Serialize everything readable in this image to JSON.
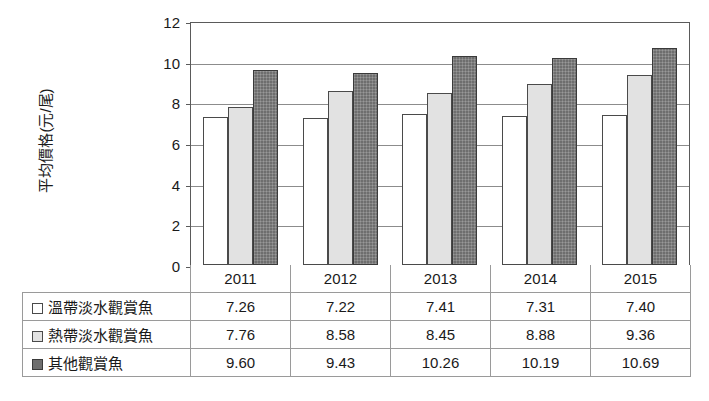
{
  "chart_data": {
    "type": "bar",
    "title": "",
    "xlabel": "",
    "ylabel": "平均價格(元/尾)",
    "ylim": [
      0,
      12
    ],
    "yticks": [
      12,
      10,
      8,
      6,
      4,
      2,
      0
    ],
    "grid": true,
    "legend_position": "table-below",
    "categories": [
      "2011",
      "2012",
      "2013",
      "2014",
      "2015"
    ],
    "series": [
      {
        "name": "溫帶淡水觀賞魚",
        "swatch": "white",
        "color": "#ffffff",
        "values": [
          7.26,
          7.22,
          7.41,
          7.31,
          7.4
        ],
        "labels": [
          "7.26",
          "7.22",
          "7.41",
          "7.31",
          "7.40"
        ]
      },
      {
        "name": "熱帶淡水觀賞魚",
        "swatch": "light-gray",
        "color": "#e2e2e2",
        "values": [
          7.76,
          8.58,
          8.45,
          8.88,
          9.36
        ],
        "labels": [
          "7.76",
          "8.58",
          "8.45",
          "8.88",
          "9.36"
        ]
      },
      {
        "name": "其他觀賞魚",
        "swatch": "dark-gray",
        "color": "#6e6e6e",
        "values": [
          9.6,
          9.43,
          10.26,
          10.19,
          10.69
        ],
        "labels": [
          "9.60",
          "9.43",
          "10.26",
          "10.19",
          "10.69"
        ]
      }
    ]
  },
  "axis": {
    "y_title": "平均價格(元/尾)",
    "tick_labels": [
      "12",
      "10",
      "8",
      "6",
      "4",
      "2",
      "0"
    ]
  },
  "table": {
    "year_headers": [
      "2011",
      "2012",
      "2013",
      "2014",
      "2015"
    ],
    "rows": [
      {
        "label": "溫帶淡水觀賞魚",
        "swatch_class": "s0",
        "values": [
          "7.26",
          "7.22",
          "7.41",
          "7.31",
          "7.40"
        ]
      },
      {
        "label": "熱帶淡水觀賞魚",
        "swatch_class": "s1",
        "values": [
          "7.76",
          "8.58",
          "8.45",
          "8.88",
          "9.36"
        ]
      },
      {
        "label": "其他觀賞魚",
        "swatch_class": "s2",
        "values": [
          "9.60",
          "9.43",
          "10.26",
          "10.19",
          "10.69"
        ]
      }
    ]
  },
  "colors": {
    "series_1": "#ffffff",
    "series_2": "#e2e2e2",
    "series_3": "#6e6e6e",
    "axis": "#5a5a5a",
    "gridline": "#8c8c8c",
    "table_border": "#9a9a9a",
    "background": "#ffffff",
    "text": "#1a1a1a"
  }
}
